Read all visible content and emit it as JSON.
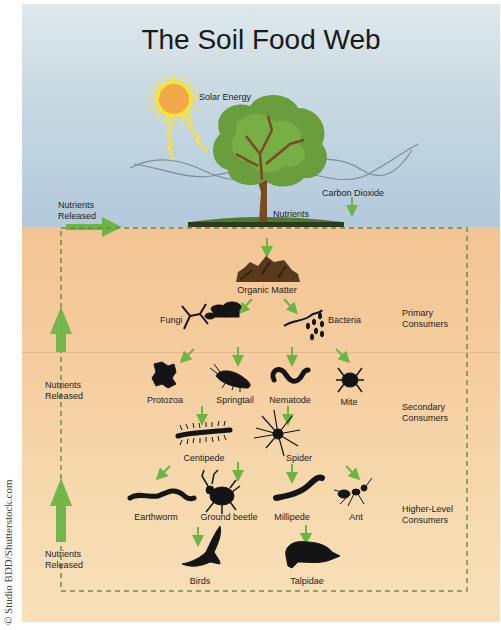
{
  "title": "The Soil Food Web",
  "copyright": "© Studio BDD/Shutterstock.com",
  "colors": {
    "sky_top": "#dfe9ea",
    "sky_bottom": "#b2c9dc",
    "soil_top": "#f3c493",
    "soil_bottom": "#f8e0b9",
    "arrow_green": "#6cb444",
    "dashed_border": "#6e8a4e",
    "silhouette": "#141414",
    "sun": "#f0a848",
    "sun_rays": "#f7e33a",
    "tree_leaves": "#6a9e3c",
    "tree_trunk": "#7a4a22"
  },
  "above_ground": {
    "solar_energy": "Solar Energy",
    "carbon_dioxide": "Carbon Dioxide",
    "nutrients": "Nutrients",
    "nutrients_released_top": [
      "Nutrients",
      "Released"
    ]
  },
  "levels": [
    {
      "name": "Primary Consumers",
      "lines": [
        "Primary",
        "Consumers"
      ]
    },
    {
      "name": "Secondary Consumers",
      "lines": [
        "Secondary",
        "Consumers"
      ]
    },
    {
      "name": "Higher-Level Consumers",
      "lines": [
        "Higher-Level",
        "Consumers"
      ]
    }
  ],
  "side_labels": {
    "middle": [
      "Nutrients",
      "Released"
    ],
    "bottom": [
      "Nutrients",
      "Released"
    ]
  },
  "nodes": {
    "organic_matter": "Organic Matter",
    "fungi": "Fungi",
    "bacteria": "Bacteria",
    "protozoa": "Protozoa",
    "springtail": "Springtail",
    "nematode": "Nematode",
    "mite": "Mite",
    "centipede": "Centipede",
    "spider": "Spider",
    "earthworm": "Earthworm",
    "ground_beetle": "Ground beetle",
    "millipede": "Millipede",
    "ant": "Ant",
    "birds": "Birds",
    "talpidae": "Talpidae"
  },
  "edges": [
    [
      "tree",
      "organic_matter"
    ],
    [
      "organic_matter",
      "fungi"
    ],
    [
      "organic_matter",
      "bacteria"
    ],
    [
      "fungi",
      "protozoa"
    ],
    [
      "fungi",
      "springtail"
    ],
    [
      "bacteria",
      "nematode"
    ],
    [
      "bacteria",
      "mite"
    ],
    [
      "protozoa",
      "centipede"
    ],
    [
      "nematode",
      "spider"
    ],
    [
      "centipede",
      "earthworm"
    ],
    [
      "centipede",
      "ground_beetle"
    ],
    [
      "spider",
      "millipede"
    ],
    [
      "spider",
      "ant"
    ],
    [
      "ground_beetle",
      "birds"
    ],
    [
      "millipede",
      "talpidae"
    ]
  ]
}
